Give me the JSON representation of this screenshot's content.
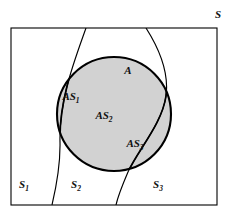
{
  "diagram": {
    "title_label": "S",
    "universe": {
      "name": "universe-rectangle",
      "label": "S",
      "label_x": 221,
      "label_y": 18,
      "rect": {
        "x": 11,
        "y": 28,
        "width": 206,
        "height": 177
      },
      "stroke": "#000000",
      "fill": "#ffffff"
    },
    "event_circle": {
      "name": "event-circle-A",
      "label": "A",
      "label_x": 128,
      "label_y": 74,
      "cx": 114,
      "cy": 114,
      "r": 57,
      "fill": "#d2d2d2",
      "stroke": "#000000"
    },
    "partitions": [
      {
        "id": "S1",
        "label": "S",
        "subscript": "1",
        "label_x": 24,
        "label_y": 188
      },
      {
        "id": "S2",
        "label": "S",
        "subscript": "2",
        "label_x": 76,
        "label_y": 188
      },
      {
        "id": "S3",
        "label": "S",
        "subscript": "3",
        "label_x": 158,
        "label_y": 188
      }
    ],
    "intersections": [
      {
        "id": "AS1",
        "label": "AS",
        "subscript": "1",
        "label_x": 71,
        "label_y": 100
      },
      {
        "id": "AS2",
        "label": "AS",
        "subscript": "2",
        "label_x": 104,
        "label_y": 119
      },
      {
        "id": "AS3",
        "label": "AS",
        "subscript": "3",
        "label_x": 135,
        "label_y": 147
      }
    ],
    "divider_curves": [
      {
        "id": "divider-left",
        "path": "M 86 28 C 74 62, 59 100, 60 142 C 60.5 166, 56 188, 52 205"
      },
      {
        "id": "divider-right",
        "path": "M 146 28 C 160 50, 169 74, 166 96 C 162 124, 138 150, 128 172 C 122 186, 118 196, 116 205"
      }
    ]
  }
}
